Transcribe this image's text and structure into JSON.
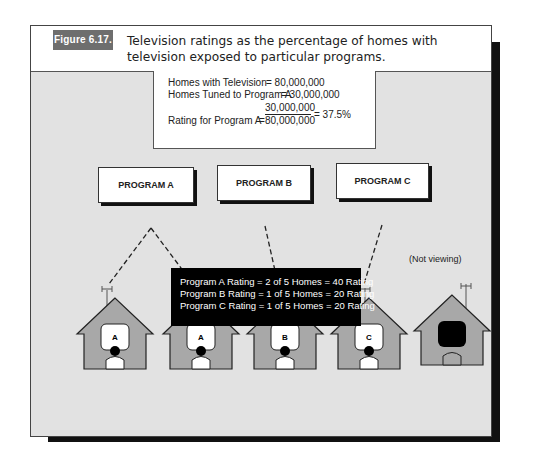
{
  "figure": {
    "label": "Figure 6.17.",
    "caption": "Television ratings as the percentage of homes with television exposed to particular programs."
  },
  "calculation": {
    "rows": [
      {
        "label": "Homes with Television",
        "value": "= 80,000,000"
      },
      {
        "label": "Homes Tuned to Program A",
        "value": "= 30,000,000"
      },
      {
        "label": "Rating for Program A",
        "numerator": "30,000,000",
        "denominator": "80,000,000",
        "result": "= 37.5%"
      }
    ]
  },
  "programs": [
    {
      "label": "PROGRAM A"
    },
    {
      "label": "PROGRAM B"
    },
    {
      "label": "PROGRAM C"
    }
  ],
  "homes": [
    {
      "tv_label": "A",
      "viewing": true
    },
    {
      "tv_label": "A",
      "viewing": true
    },
    {
      "tv_label": "B",
      "viewing": true
    },
    {
      "tv_label": "C",
      "viewing": true
    },
    {
      "tv_label": "",
      "viewing": false,
      "note": "(Not viewing)"
    }
  ],
  "summary": [
    "Program A Rating = 2 of 5 Homes = 40 Rating",
    "Program B Rating = 1 of 5 Homes = 20 Rating",
    "Program C Rating = 1 of 5 Homes = 20 Rating"
  ],
  "colors": {
    "background": "#e2e2e2",
    "house": "#a8a8a8",
    "badge": "#6e6e6e",
    "summary_bg": "#000000"
  }
}
